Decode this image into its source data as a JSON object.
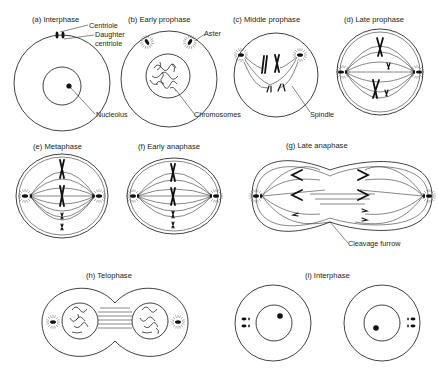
{
  "figure": {
    "panels": [
      {
        "id": "a",
        "title": "(a) Interphase",
        "labels": [
          "Centriole",
          "Daughter",
          "centriole",
          "Nucleolus"
        ]
      },
      {
        "id": "b",
        "title": "(b) Early prophase",
        "labels": [
          "Aster",
          "Chromosomes"
        ]
      },
      {
        "id": "c",
        "title": "(c) Middle prophase",
        "labels": [
          "Spindle"
        ]
      },
      {
        "id": "d",
        "title": "(d) Late prophase",
        "labels": []
      },
      {
        "id": "e",
        "title": "(e) Metaphase",
        "labels": []
      },
      {
        "id": "f",
        "title": "(f) Early anaphase",
        "labels": []
      },
      {
        "id": "g",
        "title": "(g) Late anaphase",
        "labels": [
          "Cleavage furrow"
        ]
      },
      {
        "id": "h",
        "title": "(h) Telophase",
        "labels": []
      },
      {
        "id": "i",
        "title": "(i) Interphase",
        "labels": []
      }
    ]
  },
  "colors": {
    "line": "#111111",
    "background": "#ffffff"
  }
}
